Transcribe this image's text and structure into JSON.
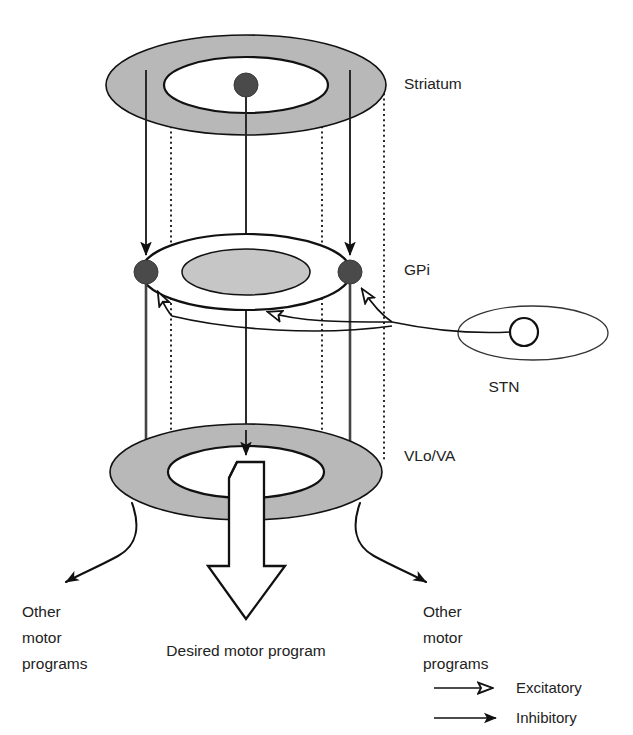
{
  "figure": {
    "background_color": "#ffffff",
    "ink_color": "#111111",
    "shade_color": "#b8b8b8"
  },
  "structures": [
    {
      "id": "striatum",
      "label": "Striatum",
      "shape": "annulus",
      "ring_fill": "#b8b8b8",
      "center_fill": "#ffffff",
      "neurons": 1
    },
    {
      "id": "gpi",
      "label": "GPi",
      "shape": "annulus-inverted",
      "ring_fill": "#ffffff",
      "center_fill": "#c6c6c6",
      "neurons": 2
    },
    {
      "id": "vlova",
      "label": "VLo/VA",
      "shape": "annulus",
      "ring_fill": "#b8b8b8",
      "center_fill": "#ffffff",
      "neurons": 0
    },
    {
      "id": "stn",
      "label": "STN",
      "shape": "ellipse-open",
      "ring_fill": "#ffffff",
      "center_fill": "#ffffff",
      "neurons": 1
    }
  ],
  "labels": {
    "striatum": "Striatum",
    "gpi": "GPi",
    "vlova": "VLo/VA",
    "stn": "STN",
    "desired_motor_program": "Desired motor program",
    "other_motor_left_line1": "Other",
    "other_motor_left_line2": "motor",
    "other_motor_left_line3": "programs",
    "other_motor_right_line1": "Other",
    "other_motor_right_line2": "motor",
    "other_motor_right_line3": "programs"
  },
  "legend": {
    "items": [
      {
        "id": "excitatory",
        "label": "Excitatory",
        "arrowhead": "open",
        "line": "solid"
      },
      {
        "id": "inhibitory",
        "label": "Inhibitory",
        "arrowhead": "filled",
        "line": "solid"
      }
    ]
  },
  "connections": [
    {
      "id": "striatum-to-gpi-left",
      "from": "striatum-surround",
      "to": "gpi-neuron-left",
      "type": "inhibitory",
      "arrowhead": "filled"
    },
    {
      "id": "striatum-to-gpi-right",
      "from": "striatum-surround",
      "to": "gpi-neuron-right",
      "type": "inhibitory",
      "arrowhead": "filled"
    },
    {
      "id": "striatum-center-to-vlova",
      "from": "striatum-neuron-center",
      "to": "vlova-center",
      "type": "inhibitory",
      "arrowhead": "filled"
    },
    {
      "id": "stn-to-gpi-left",
      "from": "stn-neuron",
      "to": "gpi-neuron-left",
      "type": "excitatory",
      "arrowhead": "open"
    },
    {
      "id": "stn-to-gpi-center",
      "from": "stn-neuron",
      "to": "gpi-center",
      "type": "excitatory",
      "arrowhead": "open"
    },
    {
      "id": "stn-to-gpi-right",
      "from": "stn-neuron",
      "to": "gpi-neuron-right",
      "type": "excitatory",
      "arrowhead": "open"
    },
    {
      "id": "gpi-left-to-vlova",
      "from": "gpi-neuron-left",
      "to": "vlova-ring",
      "type": "inhibitory",
      "arrowhead": "none"
    },
    {
      "id": "gpi-right-to-vlova",
      "from": "gpi-neuron-right",
      "to": "vlova-ring",
      "type": "inhibitory",
      "arrowhead": "none"
    },
    {
      "id": "vlova-to-other-left",
      "from": "vlova-ring",
      "to": "other-motor-left",
      "type": "output",
      "arrowhead": "filled"
    },
    {
      "id": "vlova-to-other-right",
      "from": "vlova-ring",
      "to": "other-motor-right",
      "type": "output",
      "arrowhead": "filled"
    },
    {
      "id": "vlova-to-desired",
      "from": "vlova-center",
      "to": "desired-motor-program",
      "type": "output",
      "arrowhead": "block"
    }
  ]
}
